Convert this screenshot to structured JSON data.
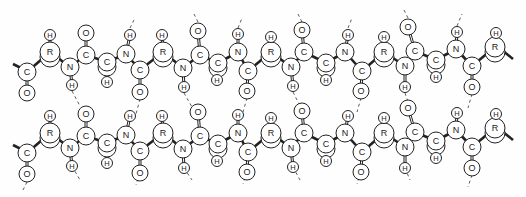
{
  "diagram": {
    "legend": {
      "C": "carbon",
      "N": "nitrogen",
      "O": "oxygen",
      "H": "hydrogen",
      "R": "side chain"
    },
    "row_offset_y": 81,
    "chain_template": [
      {
        "el": "C",
        "x": 27,
        "y": 72,
        "r": 9
      },
      {
        "el": "O",
        "x": 27,
        "y": 93,
        "r": 8
      },
      {
        "el": "R",
        "x": 50,
        "y": 52,
        "r": 10
      },
      {
        "el": "H",
        "x": 50,
        "y": 35,
        "r": 5.5
      },
      {
        "el": "N",
        "x": 70,
        "y": 67,
        "r": 9
      },
      {
        "el": "H",
        "x": 72,
        "y": 85,
        "r": 5.5
      },
      {
        "el": "C",
        "x": 86,
        "y": 55,
        "r": 9
      },
      {
        "el": "O",
        "x": 86,
        "y": 33,
        "r": 8
      },
      {
        "el": "C",
        "x": 107,
        "y": 62,
        "r": 9
      },
      {
        "el": "H",
        "x": 107,
        "y": 82,
        "r": 5.5
      },
      {
        "el": "N",
        "x": 126,
        "y": 54,
        "r": 9
      },
      {
        "el": "H",
        "x": 130,
        "y": 35,
        "r": 5.5
      },
      {
        "el": "C",
        "x": 140,
        "y": 70,
        "r": 9
      },
      {
        "el": "O",
        "x": 140,
        "y": 92,
        "r": 8
      },
      {
        "el": "R",
        "x": 163,
        "y": 52,
        "r": 10
      },
      {
        "el": "H",
        "x": 162,
        "y": 35,
        "r": 5.5
      },
      {
        "el": "N",
        "x": 183,
        "y": 68,
        "r": 9
      },
      {
        "el": "H",
        "x": 184,
        "y": 87,
        "r": 5.5
      },
      {
        "el": "C",
        "x": 200,
        "y": 55,
        "r": 9
      },
      {
        "el": "O",
        "x": 198,
        "y": 31,
        "r": 8
      },
      {
        "el": "C",
        "x": 218,
        "y": 63,
        "r": 9
      },
      {
        "el": "H",
        "x": 217,
        "y": 80,
        "r": 5.5
      },
      {
        "el": "N",
        "x": 238,
        "y": 52,
        "r": 9
      },
      {
        "el": "H",
        "x": 238,
        "y": 34,
        "r": 5.5
      },
      {
        "el": "C",
        "x": 248,
        "y": 71,
        "r": 9
      },
      {
        "el": "O",
        "x": 247,
        "y": 91,
        "r": 8
      },
      {
        "el": "R",
        "x": 271,
        "y": 52,
        "r": 10
      },
      {
        "el": "H",
        "x": 271,
        "y": 37,
        "r": 5.5
      },
      {
        "el": "N",
        "x": 291,
        "y": 67,
        "r": 9
      },
      {
        "el": "H",
        "x": 293,
        "y": 86,
        "r": 5.5
      },
      {
        "el": "C",
        "x": 304,
        "y": 52,
        "r": 9
      },
      {
        "el": "O",
        "x": 302,
        "y": 30,
        "r": 8
      },
      {
        "el": "C",
        "x": 326,
        "y": 63,
        "r": 9
      },
      {
        "el": "H",
        "x": 326,
        "y": 80,
        "r": 5.5
      },
      {
        "el": "N",
        "x": 345,
        "y": 52,
        "r": 9
      },
      {
        "el": "H",
        "x": 348,
        "y": 35,
        "r": 5.5
      },
      {
        "el": "C",
        "x": 362,
        "y": 71,
        "r": 9
      },
      {
        "el": "O",
        "x": 361,
        "y": 91,
        "r": 8
      },
      {
        "el": "R",
        "x": 384,
        "y": 52,
        "r": 10
      },
      {
        "el": "H",
        "x": 384,
        "y": 37,
        "r": 5.5
      },
      {
        "el": "N",
        "x": 405,
        "y": 66,
        "r": 9
      },
      {
        "el": "H",
        "x": 405,
        "y": 87,
        "r": 5.5
      },
      {
        "el": "C",
        "x": 415,
        "y": 51,
        "r": 9
      },
      {
        "el": "O",
        "x": 408,
        "y": 27,
        "r": 8
      },
      {
        "el": "C",
        "x": 436,
        "y": 60,
        "r": 9
      },
      {
        "el": "H",
        "x": 436,
        "y": 77,
        "r": 5.5
      },
      {
        "el": "N",
        "x": 456,
        "y": 49,
        "r": 9
      },
      {
        "el": "H",
        "x": 457,
        "y": 32,
        "r": 5.5
      },
      {
        "el": "C",
        "x": 472,
        "y": 66,
        "r": 9
      },
      {
        "el": "O",
        "x": 472,
        "y": 87,
        "r": 8
      },
      {
        "el": "R",
        "x": 495,
        "y": 47,
        "r": 10
      },
      {
        "el": "H",
        "x": 496,
        "y": 33,
        "r": 5.5
      }
    ],
    "backbone_order": [
      0,
      2,
      4,
      6,
      8,
      10,
      12,
      14,
      16,
      18,
      20,
      22,
      24,
      26,
      28,
      30,
      32,
      34,
      36,
      38,
      40,
      42,
      44,
      46,
      48,
      50
    ],
    "side_bonds": [
      [
        0,
        1
      ],
      [
        2,
        3
      ],
      [
        4,
        5
      ],
      [
        6,
        7
      ],
      [
        8,
        9
      ],
      [
        10,
        11
      ],
      [
        12,
        13
      ],
      [
        14,
        15
      ],
      [
        16,
        17
      ],
      [
        18,
        19
      ],
      [
        20,
        21
      ],
      [
        22,
        23
      ],
      [
        24,
        25
      ],
      [
        26,
        27
      ],
      [
        28,
        29
      ],
      [
        30,
        31
      ],
      [
        32,
        33
      ],
      [
        34,
        35
      ],
      [
        36,
        37
      ],
      [
        38,
        39
      ],
      [
        40,
        41
      ],
      [
        42,
        43
      ],
      [
        44,
        45
      ],
      [
        46,
        47
      ],
      [
        48,
        49
      ],
      [
        50,
        51
      ]
    ],
    "hbonds_top": [
      [
        130,
        28,
        135,
        18
      ],
      [
        198,
        22,
        194,
        14
      ],
      [
        238,
        28,
        242,
        18
      ],
      [
        302,
        22,
        298,
        14
      ],
      [
        348,
        28,
        352,
        18
      ],
      [
        408,
        18,
        404,
        10
      ],
      [
        457,
        26,
        462,
        14
      ]
    ],
    "hbonds_between": [
      [
        72,
        91,
        80,
        106
      ],
      [
        140,
        99,
        136,
        114
      ],
      [
        184,
        93,
        192,
        107
      ],
      [
        247,
        98,
        243,
        112
      ],
      [
        293,
        92,
        300,
        106
      ],
      [
        361,
        98,
        357,
        112
      ],
      [
        405,
        93,
        410,
        107
      ],
      [
        472,
        94,
        468,
        108
      ]
    ],
    "hbonds_bottom": [
      [
        27,
        182,
        22,
        192
      ],
      [
        72,
        166,
        80,
        180
      ],
      [
        140,
        173,
        136,
        185
      ],
      [
        184,
        168,
        192,
        180
      ],
      [
        247,
        172,
        243,
        184
      ],
      [
        293,
        167,
        300,
        180
      ],
      [
        361,
        172,
        357,
        184
      ],
      [
        405,
        168,
        410,
        180
      ],
      [
        472,
        175,
        468,
        187
      ]
    ]
  }
}
